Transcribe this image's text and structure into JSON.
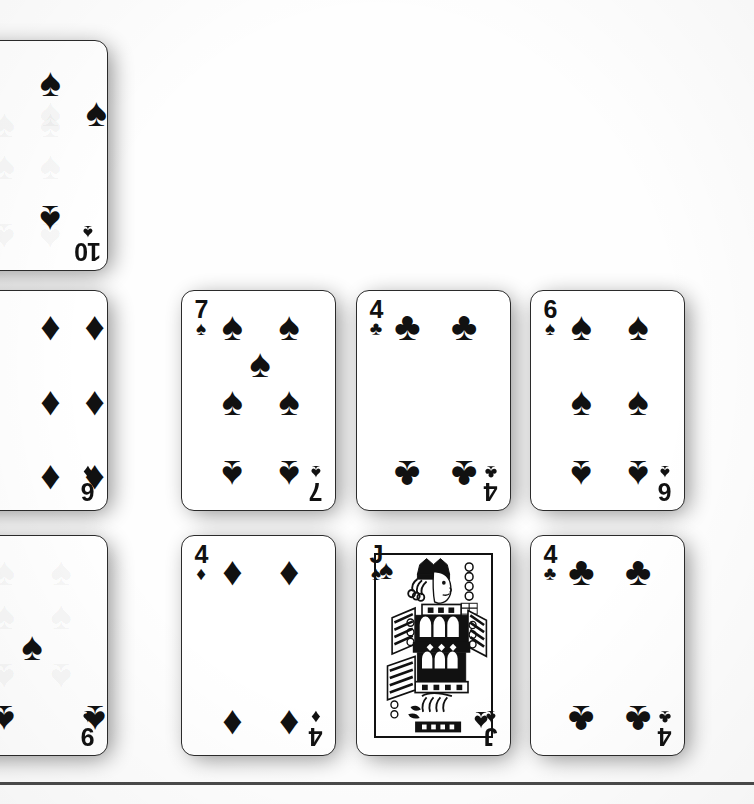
{
  "scene": {
    "title": "Playing cards scan",
    "background_color": "#fefefe",
    "card_face_color": "#ffffff",
    "ink_color": "#111111",
    "shadow_color": "#000000",
    "rule_color": "#4a4a4a"
  },
  "glyphs": {
    "spade": "♠",
    "heart": "♥",
    "diamond": "♦",
    "club": "♣"
  },
  "cards": [
    {
      "id": "card-10-spades",
      "rank": "10",
      "suit": "spades",
      "suit_symbol": "♠",
      "name": "ten-of-spades",
      "clipped": "left",
      "note": "partially faded print, ghost pips visible"
    },
    {
      "id": "card-6-diamonds",
      "rank": "6",
      "suit": "diamonds",
      "suit_symbol": "♦",
      "name": "six-of-diamonds",
      "clipped": "left",
      "note": ""
    },
    {
      "id": "card-7-spades",
      "rank": "7",
      "suit": "spades",
      "suit_symbol": "♠",
      "name": "seven-of-spades",
      "clipped": "none",
      "note": ""
    },
    {
      "id": "card-4-clubs-top",
      "rank": "4",
      "suit": "clubs",
      "suit_symbol": "♣",
      "name": "four-of-clubs",
      "clipped": "none",
      "note": ""
    },
    {
      "id": "card-6-spades",
      "rank": "6",
      "suit": "spades",
      "suit_symbol": "♠",
      "name": "six-of-spades",
      "clipped": "none",
      "note": ""
    },
    {
      "id": "card-9-spades",
      "rank": "9",
      "suit": "spades",
      "suit_symbol": "♠",
      "name": "nine-of-spades",
      "clipped": "left",
      "note": "partially faded print, ghost pips visible"
    },
    {
      "id": "card-4-diamonds",
      "rank": "4",
      "suit": "diamonds",
      "suit_symbol": "♦",
      "name": "four-of-diamonds",
      "clipped": "none",
      "note": ""
    },
    {
      "id": "card-j-spades",
      "rank": "J",
      "suit": "spades",
      "suit_symbol": "♠",
      "name": "jack-of-spades",
      "clipped": "none",
      "note": "court card with profile figure"
    },
    {
      "id": "card-4-clubs-bottom",
      "rank": "4",
      "suit": "clubs",
      "suit_symbol": "♣",
      "name": "four-of-clubs",
      "clipped": "none",
      "note": ""
    }
  ]
}
